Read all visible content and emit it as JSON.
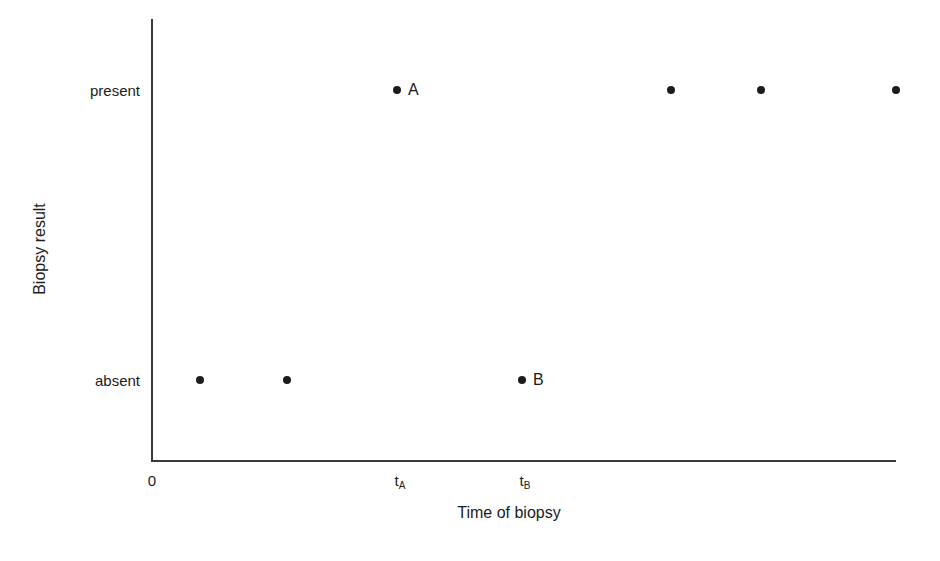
{
  "chart_data": {
    "type": "scatter",
    "title": "",
    "xlabel": "Time of biopsy",
    "ylabel": "Biopsy result",
    "grid": false,
    "legend": "none",
    "y_categories": [
      "absent",
      "present"
    ],
    "x_ticks": [
      {
        "label": "0",
        "sub": "",
        "px": 152
      },
      {
        "label": "t",
        "sub": "A",
        "px": 400
      },
      {
        "label": "t",
        "sub": "B",
        "px": 525
      }
    ],
    "axis_ranges": {
      "x_px": [
        152,
        896
      ],
      "y_px": [
        461,
        20
      ]
    },
    "points": [
      {
        "name": "point-1",
        "x_px": 200,
        "y_px": 380,
        "result": "absent",
        "label": ""
      },
      {
        "name": "point-2",
        "x_px": 287,
        "y_px": 380,
        "result": "absent",
        "label": ""
      },
      {
        "name": "point-A",
        "x_px": 397,
        "y_px": 90,
        "result": "present",
        "label": "A"
      },
      {
        "name": "point-B",
        "x_px": 522,
        "y_px": 380,
        "result": "absent",
        "label": "B"
      },
      {
        "name": "point-3",
        "x_px": 671,
        "y_px": 90,
        "result": "present",
        "label": ""
      },
      {
        "name": "point-4",
        "x_px": 761,
        "y_px": 90,
        "result": "present",
        "label": ""
      },
      {
        "name": "point-5",
        "x_px": 896,
        "y_px": 90,
        "result": "present",
        "label": ""
      }
    ],
    "y_tick_positions": [
      {
        "label": "present",
        "px": 90
      },
      {
        "label": "absent",
        "px": 380
      }
    ],
    "colors": {
      "marker": "#1c1c1c",
      "axis": "#3a3a3a",
      "text": "#1c1c1c",
      "background": "#ffffff"
    }
  }
}
